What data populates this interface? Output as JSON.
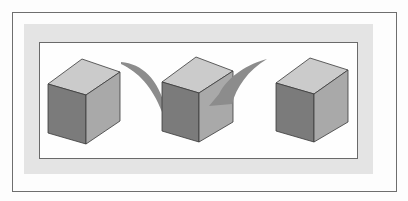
{
  "figure": {
    "colors": {
      "page_background": "#fdfdfd",
      "outer_frame_stroke": "#6e6e6e",
      "band_fill": "#e4e4e4",
      "inner_panel_fill": "#fefefe",
      "inner_frame_stroke": "#6a6a6a",
      "cube_top": "#cbcbcb",
      "cube_left": "#7b7b7b",
      "cube_right": "#a9a9a9",
      "cube_edge": "#3a3a3a",
      "checkmark": "#8c8c8c"
    },
    "frames": {
      "outer": {
        "x": 12,
        "y": 12,
        "width": 384,
        "height": 179
      },
      "band": {
        "x": 24,
        "y": 24,
        "width": 349,
        "height": 150
      },
      "inner": {
        "x": 39,
        "y": 42,
        "width": 318,
        "height": 116
      }
    },
    "cubes": [
      {
        "name": "left",
        "top_back": [
          82,
          59
        ],
        "top_left": [
          48,
          84
        ],
        "front_top": [
          86,
          95
        ],
        "top_right": [
          120,
          72
        ],
        "bottom_left": [
          48,
          133
        ],
        "bottom_front": [
          86,
          144
        ],
        "bottom_right": [
          120,
          121
        ]
      },
      {
        "name": "center",
        "top_back": [
          196,
          57
        ],
        "top_left": [
          162,
          82
        ],
        "front_top": [
          199,
          93
        ],
        "top_right": [
          233,
          71
        ],
        "bottom_left": [
          162,
          131
        ],
        "bottom_front": [
          199,
          142
        ],
        "bottom_right": [
          233,
          122
        ]
      },
      {
        "name": "right",
        "top_back": [
          310,
          58
        ],
        "top_left": [
          276,
          83
        ],
        "front_top": [
          314,
          94
        ],
        "top_right": [
          348,
          70
        ],
        "bottom_left": [
          276,
          131
        ],
        "bottom_front": [
          314,
          142
        ],
        "bottom_right": [
          348,
          122
        ]
      }
    ],
    "checkmark": {
      "left_arm_tip": [
        121,
        63
      ],
      "right_arm_tip": [
        267,
        59
      ]
    }
  }
}
